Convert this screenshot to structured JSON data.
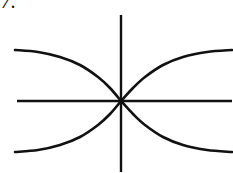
{
  "figure": {
    "item_label": "7.",
    "background_color": "#ffffff",
    "ink_color": "#111111",
    "axis_stroke_width": 2.4,
    "curve_stroke_width": 2.6
  },
  "chart_data": {
    "type": "line",
    "title": "",
    "subtitle": "",
    "xlabel": "",
    "ylabel": "",
    "grid": false,
    "legend_position": "none",
    "axes": {
      "origin_px": [
        121,
        101
      ],
      "x_axis": {
        "x_start_px": 17,
        "x_end_px": 232,
        "y_px": 101
      },
      "y_axis": {
        "y_start_px": 15,
        "y_end_px": 172,
        "x_px": 121
      },
      "xlim": [
        -1,
        1
      ],
      "ylim": [
        -1,
        1
      ],
      "tick_labels_x": [],
      "tick_labels_y": []
    },
    "series": [
      {
        "name": "upper-left-branch",
        "description": "descends from upper left to origin",
        "points_px": [
          [
            15,
            50
          ],
          [
            38,
            52
          ],
          [
            60,
            57
          ],
          [
            80,
            65
          ],
          [
            98,
            77
          ],
          [
            110,
            88
          ],
          [
            121,
            101
          ]
        ]
      },
      {
        "name": "upper-right-branch",
        "description": "rises from origin to upper right",
        "points_px": [
          [
            121,
            101
          ],
          [
            133,
            88
          ],
          [
            145,
            77
          ],
          [
            163,
            65
          ],
          [
            183,
            57
          ],
          [
            207,
            52
          ],
          [
            232,
            50
          ]
        ]
      },
      {
        "name": "lower-left-branch",
        "description": "rises from lower left to origin",
        "points_px": [
          [
            15,
            152
          ],
          [
            38,
            150
          ],
          [
            60,
            145
          ],
          [
            80,
            137
          ],
          [
            98,
            125
          ],
          [
            110,
            114
          ],
          [
            121,
            101
          ]
        ]
      },
      {
        "name": "lower-right-branch",
        "description": "descends from origin to lower right",
        "points_px": [
          [
            121,
            101
          ],
          [
            133,
            114
          ],
          [
            145,
            125
          ],
          [
            163,
            137
          ],
          [
            183,
            145
          ],
          [
            207,
            150
          ],
          [
            232,
            152
          ]
        ]
      }
    ],
    "annotations": [
      {
        "text": "7.",
        "position_px": [
          6,
          6
        ],
        "role": "item-number"
      }
    ]
  }
}
